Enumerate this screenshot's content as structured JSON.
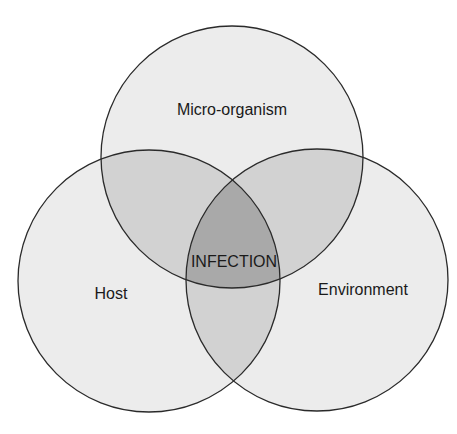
{
  "diagram": {
    "type": "venn",
    "sets": [
      {
        "id": "microorganism",
        "label": "Micro-organism"
      },
      {
        "id": "host",
        "label": "Host"
      },
      {
        "id": "environment",
        "label": "Environment"
      }
    ],
    "intersection_label": "INFECTION",
    "colors": {
      "single": "#ececec",
      "double": "#d2d2d2",
      "triple": "#a9a9a9",
      "stroke": "#2a2a2a",
      "background": "#ffffff"
    }
  }
}
